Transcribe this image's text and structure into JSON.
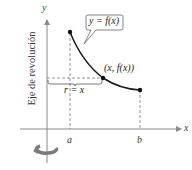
{
  "diagram": {
    "axes": {
      "x_label": "x",
      "y_label": "y"
    },
    "axis_of_revolution_label": "Eje de revolución",
    "callout_label": "y = f(x)",
    "point_label": "(x, f(x))",
    "radius_label": "r = x",
    "tick_labels": {
      "a": "a",
      "b": "b"
    },
    "colors": {
      "axis": "#8a8a8a",
      "curve": "#1a1a1a",
      "dashed": "#777777",
      "rotation_arrow": "#7a7a7a",
      "text": "#333333"
    }
  }
}
